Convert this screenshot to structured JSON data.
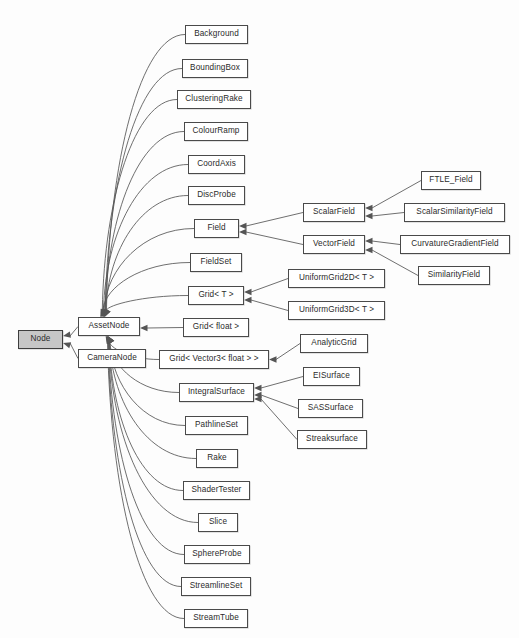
{
  "diagram": {
    "type": "uml-class-inheritance",
    "background_color": "#fdfdfd",
    "box_fill_color": "#ffffff",
    "root_box_fill_color": "#c6c6c6",
    "border_color": "#4a4a4a",
    "edge_color": "#555555",
    "nodes": [
      {
        "id": "node",
        "label": "Node",
        "x": 18,
        "y": 330,
        "w": 45,
        "h": 19,
        "root": true
      },
      {
        "id": "assetnode",
        "label": "AssetNode",
        "x": 78,
        "y": 317,
        "w": 62,
        "h": 19,
        "root": false
      },
      {
        "id": "cameranode",
        "label": "CameraNode",
        "x": 78,
        "y": 349,
        "w": 68,
        "h": 19,
        "root": false
      },
      {
        "id": "background",
        "label": "Background",
        "x": 185,
        "y": 25,
        "w": 63,
        "h": 19,
        "root": false
      },
      {
        "id": "boundingbox",
        "label": "BoundingBox",
        "x": 182,
        "y": 59,
        "w": 66,
        "h": 19,
        "root": false
      },
      {
        "id": "clusteringrake",
        "label": "ClusteringRake",
        "x": 177,
        "y": 90,
        "w": 74,
        "h": 19,
        "root": false
      },
      {
        "id": "colourramp",
        "label": "ColourRamp",
        "x": 184,
        "y": 122,
        "w": 64,
        "h": 19,
        "root": false
      },
      {
        "id": "coordaxis",
        "label": "CoordAxis",
        "x": 188,
        "y": 155,
        "w": 57,
        "h": 19,
        "root": false
      },
      {
        "id": "discprobe",
        "label": "DiscProbe",
        "x": 188,
        "y": 186,
        "w": 57,
        "h": 19,
        "root": false
      },
      {
        "id": "field",
        "label": "Field",
        "x": 194,
        "y": 219,
        "w": 45,
        "h": 19,
        "root": false
      },
      {
        "id": "fieldset",
        "label": "FieldSet",
        "x": 190,
        "y": 253,
        "w": 52,
        "h": 19,
        "root": false
      },
      {
        "id": "gridt",
        "label": "Grid< T >",
        "x": 188,
        "y": 286,
        "w": 56,
        "h": 19,
        "root": false
      },
      {
        "id": "gridfloat",
        "label": "Grid< float >",
        "x": 183,
        "y": 318,
        "w": 66,
        "h": 19,
        "root": false
      },
      {
        "id": "gridvector3float",
        "label": "Grid< Vector3< float > >",
        "x": 159,
        "y": 350,
        "w": 110,
        "h": 19,
        "root": false
      },
      {
        "id": "integralsurface",
        "label": "IntegralSurface",
        "x": 179,
        "y": 383,
        "w": 75,
        "h": 19,
        "root": false
      },
      {
        "id": "pathlineset",
        "label": "PathlineSet",
        "x": 185,
        "y": 416,
        "w": 63,
        "h": 19,
        "root": false
      },
      {
        "id": "rake",
        "label": "Rake",
        "x": 196,
        "y": 449,
        "w": 42,
        "h": 19,
        "root": false
      },
      {
        "id": "shadertester",
        "label": "ShaderTester",
        "x": 183,
        "y": 481,
        "w": 67,
        "h": 19,
        "root": false
      },
      {
        "id": "slice",
        "label": "Slice",
        "x": 198,
        "y": 513,
        "w": 40,
        "h": 19,
        "root": false
      },
      {
        "id": "sphereprobe",
        "label": "SphereProbe",
        "x": 184,
        "y": 545,
        "w": 66,
        "h": 19,
        "root": false
      },
      {
        "id": "streamlineset",
        "label": "StreamlineSet",
        "x": 181,
        "y": 577,
        "w": 70,
        "h": 19,
        "root": false
      },
      {
        "id": "streamtube",
        "label": "StreamTube",
        "x": 184,
        "y": 609,
        "w": 64,
        "h": 19,
        "root": false
      },
      {
        "id": "scalarfield",
        "label": "ScalarField",
        "x": 303,
        "y": 203,
        "w": 62,
        "h": 19,
        "root": false
      },
      {
        "id": "vectorfield",
        "label": "VectorField",
        "x": 303,
        "y": 235,
        "w": 62,
        "h": 19,
        "root": false
      },
      {
        "id": "ftlefield",
        "label": "FTLE_Field",
        "x": 421,
        "y": 171,
        "w": 60,
        "h": 19,
        "root": false
      },
      {
        "id": "scalarsimilarity",
        "label": "ScalarSimilarityField",
        "x": 404,
        "y": 203,
        "w": 101,
        "h": 19,
        "root": false
      },
      {
        "id": "curvaturegradient",
        "label": "CurvatureGradientField",
        "x": 400,
        "y": 235,
        "w": 110,
        "h": 19,
        "root": false
      },
      {
        "id": "similarityfield",
        "label": "SimilarityField",
        "x": 418,
        "y": 266,
        "w": 72,
        "h": 19,
        "root": false
      },
      {
        "id": "uniformgrid2d",
        "label": "UniformGrid2D< T >",
        "x": 288,
        "y": 269,
        "w": 97,
        "h": 19,
        "root": false
      },
      {
        "id": "uniformgrid3d",
        "label": "UniformGrid3D< T >",
        "x": 288,
        "y": 301,
        "w": 97,
        "h": 19,
        "root": false
      },
      {
        "id": "analyticgrid",
        "label": "AnalyticGrid",
        "x": 300,
        "y": 334,
        "w": 68,
        "h": 19,
        "root": false
      },
      {
        "id": "eisurface",
        "label": "EISurface",
        "x": 303,
        "y": 367,
        "w": 57,
        "h": 19,
        "root": false
      },
      {
        "id": "sassurface",
        "label": "SASSurface",
        "x": 298,
        "y": 399,
        "w": 65,
        "h": 19,
        "root": false
      },
      {
        "id": "streaksurface",
        "label": "Streaksurface",
        "x": 297,
        "y": 430,
        "w": 70,
        "h": 19,
        "root": false
      }
    ],
    "edges": [
      {
        "from": "assetnode",
        "to": "node",
        "style": "fan-left"
      },
      {
        "from": "cameranode",
        "to": "node",
        "style": "fan-left"
      },
      {
        "from": "background",
        "to": "assetnode",
        "style": "fan-up"
      },
      {
        "from": "boundingbox",
        "to": "assetnode",
        "style": "fan-up"
      },
      {
        "from": "clusteringrake",
        "to": "assetnode",
        "style": "fan-up"
      },
      {
        "from": "colourramp",
        "to": "assetnode",
        "style": "fan-up"
      },
      {
        "from": "coordaxis",
        "to": "assetnode",
        "style": "fan-up"
      },
      {
        "from": "discprobe",
        "to": "assetnode",
        "style": "fan-up"
      },
      {
        "from": "field",
        "to": "assetnode",
        "style": "fan-up"
      },
      {
        "from": "fieldset",
        "to": "assetnode",
        "style": "fan-up"
      },
      {
        "from": "gridt",
        "to": "assetnode",
        "style": "fan-up"
      },
      {
        "from": "gridfloat",
        "to": "assetnode",
        "style": "straight"
      },
      {
        "from": "gridvector3float",
        "to": "assetnode",
        "style": "fan-down"
      },
      {
        "from": "integralsurface",
        "to": "assetnode",
        "style": "fan-down"
      },
      {
        "from": "pathlineset",
        "to": "assetnode",
        "style": "fan-down"
      },
      {
        "from": "rake",
        "to": "assetnode",
        "style": "fan-down"
      },
      {
        "from": "shadertester",
        "to": "assetnode",
        "style": "fan-down"
      },
      {
        "from": "slice",
        "to": "assetnode",
        "style": "fan-down"
      },
      {
        "from": "sphereprobe",
        "to": "assetnode",
        "style": "fan-down"
      },
      {
        "from": "streamlineset",
        "to": "assetnode",
        "style": "fan-down"
      },
      {
        "from": "streamtube",
        "to": "assetnode",
        "style": "fan-down"
      },
      {
        "from": "scalarfield",
        "to": "field",
        "style": "straight"
      },
      {
        "from": "vectorfield",
        "to": "field",
        "style": "straight"
      },
      {
        "from": "ftlefield",
        "to": "scalarfield",
        "style": "straight"
      },
      {
        "from": "scalarsimilarity",
        "to": "scalarfield",
        "style": "straight"
      },
      {
        "from": "curvaturegradient",
        "to": "vectorfield",
        "style": "straight"
      },
      {
        "from": "similarityfield",
        "to": "vectorfield",
        "style": "straight"
      },
      {
        "from": "uniformgrid2d",
        "to": "gridt",
        "style": "straight"
      },
      {
        "from": "uniformgrid3d",
        "to": "gridt",
        "style": "straight"
      },
      {
        "from": "analyticgrid",
        "to": "gridvector3float",
        "style": "straight"
      },
      {
        "from": "eisurface",
        "to": "integralsurface",
        "style": "straight"
      },
      {
        "from": "sassurface",
        "to": "integralsurface",
        "style": "straight"
      },
      {
        "from": "streaksurface",
        "to": "integralsurface",
        "style": "straight"
      }
    ]
  }
}
